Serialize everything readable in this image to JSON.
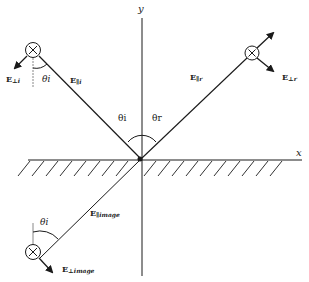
{
  "diagram": {
    "axes": {
      "x_label": "x",
      "y_label": "y"
    },
    "angles": {
      "incident": "θi",
      "reflected": "θr",
      "incident_sub_label": "θi",
      "image_sub_label": "θi"
    },
    "labels": {
      "E_perp_i": {
        "base": "E",
        "sub": "⊥i"
      },
      "E_par_i": {
        "base": "E",
        "sub": "∥i"
      },
      "E_par_r": {
        "base": "E",
        "sub": "∥r"
      },
      "E_perp_r": {
        "base": "E",
        "sub": "⊥r"
      },
      "E_par_image": {
        "base": "E",
        "sub": "∥image"
      },
      "E_perp_image": {
        "base": "E",
        "sub": "⊥image"
      }
    },
    "colors": {
      "line": "#1a1a1a",
      "background": "#ffffff"
    }
  }
}
